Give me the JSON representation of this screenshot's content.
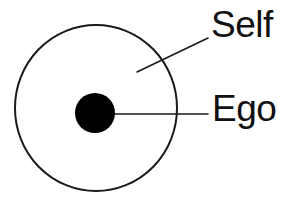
{
  "diagram": {
    "background_color": "#ffffff",
    "stroke_color": "#1a1a1a",
    "fill_color": "#000000",
    "text_color": "#111111",
    "labels": {
      "self": "Self",
      "ego": "Ego"
    },
    "shapes": {
      "outer_circle": {
        "name": "self-circle",
        "cx": 96,
        "cy": 108,
        "rx": 81,
        "ry": 83,
        "stroke_width": 2,
        "fill": "none"
      },
      "inner_dot": {
        "name": "ego-dot",
        "cx": 95,
        "cy": 113,
        "r": 20,
        "fill": "#000000"
      }
    },
    "leader_lines": {
      "self": {
        "x1": 137,
        "y1": 72,
        "x2": 208,
        "y2": 38,
        "stroke_width": 1.6
      },
      "ego": {
        "x1": 110,
        "y1": 114,
        "x2": 208,
        "y2": 114,
        "stroke_width": 1.6
      }
    }
  }
}
